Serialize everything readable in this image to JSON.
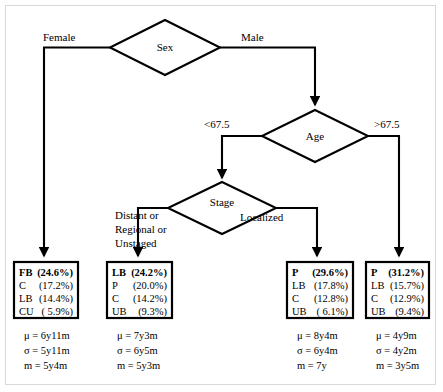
{
  "diagram": {
    "type": "decision-tree",
    "root": "Sex",
    "nodes": [
      {
        "id": "sex",
        "label": "Sex"
      },
      {
        "id": "age",
        "label": "Age"
      },
      {
        "id": "stage",
        "label": "Stage"
      }
    ],
    "edge_labels": {
      "female": "Female",
      "male": "Male",
      "age_low": "<67.5",
      "age_high": ">67.5",
      "stage_distant": "Distant or\nRegional or\nUnstaged",
      "stage_distant_lines": [
        "Distant or",
        "Regional or",
        "Unstaged"
      ],
      "stage_localized": "Localized"
    },
    "leaves": [
      {
        "id": "leaf-fb",
        "head_label": "FB",
        "head_value": "(24.6%)",
        "rows": [
          {
            "key": "C",
            "value": "(17.2%)"
          },
          {
            "key": "LB",
            "value": "(14.4%)"
          },
          {
            "key": "CU",
            "value": "( 5.9%)"
          }
        ],
        "stats": [
          "μ = 6y11m",
          "σ = 5y11m",
          "m = 5y4m"
        ]
      },
      {
        "id": "leaf-lb",
        "head_label": "LB",
        "head_value": "(24.2%)",
        "rows": [
          {
            "key": "P",
            "value": "(20.0%)"
          },
          {
            "key": "C",
            "value": "(14.2%)"
          },
          {
            "key": "UB",
            "value": "(9.3%)"
          }
        ],
        "stats": [
          "μ = 7y3m",
          "σ = 6y5m",
          "m = 5y3m"
        ]
      },
      {
        "id": "leaf-p-localized",
        "head_label": "P",
        "head_value": "(29.6%)",
        "rows": [
          {
            "key": "LB",
            "value": "(17.8%)"
          },
          {
            "key": "C",
            "value": "(12.8%)"
          },
          {
            "key": "UB",
            "value": "( 6.1%)"
          }
        ],
        "stats": [
          "μ = 8y4m",
          "σ = 6y4m",
          "m = 7y"
        ]
      },
      {
        "id": "leaf-p-older",
        "head_label": "P",
        "head_value": "(31.2%)",
        "rows": [
          {
            "key": "LB",
            "value": "(15.7%)"
          },
          {
            "key": "C",
            "value": "(12.9%)"
          },
          {
            "key": "UB",
            "value": "(9.4%)"
          }
        ],
        "stats": [
          "μ = 4y9m",
          "σ = 4y2m",
          "m = 3y5m"
        ]
      }
    ],
    "colors": {
      "line": "#000000",
      "background": "#ffffff",
      "frame": "#d9d9d9"
    }
  }
}
